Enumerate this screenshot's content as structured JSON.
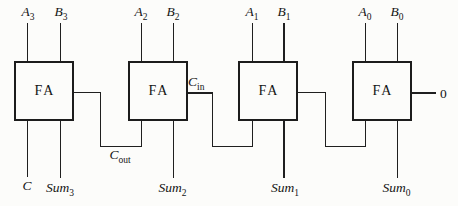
{
  "diagram": {
    "background": "#fcfcfa",
    "line_color": "#1f1f1f",
    "blocks": [
      {
        "label": "FA",
        "input_a": {
          "base": "A",
          "sub": "3"
        },
        "input_b": {
          "base": "B",
          "sub": "3"
        },
        "outputs": {
          "carry": {
            "base": "C",
            "sub": ""
          },
          "sum": {
            "base": "Sum",
            "sub": "3"
          }
        }
      },
      {
        "label": "FA",
        "input_a": {
          "base": "A",
          "sub": "2"
        },
        "input_b": {
          "base": "B",
          "sub": "2"
        },
        "outputs": {
          "sum": {
            "base": "Sum",
            "sub": "2"
          }
        }
      },
      {
        "label": "FA",
        "input_a": {
          "base": "A",
          "sub": "1"
        },
        "input_b": {
          "base": "B",
          "sub": "1"
        },
        "outputs": {
          "sum": {
            "base": "Sum",
            "sub": "1"
          }
        }
      },
      {
        "label": "FA",
        "input_a": {
          "base": "A",
          "sub": "0"
        },
        "input_b": {
          "base": "B",
          "sub": "0"
        },
        "outputs": {
          "sum": {
            "base": "Sum",
            "sub": "0"
          }
        }
      }
    ],
    "labels": {
      "carry_out": {
        "base": "C",
        "sub": "out"
      },
      "carry_in": {
        "base": "C",
        "sub": "in"
      },
      "initial_carry": "0"
    }
  }
}
